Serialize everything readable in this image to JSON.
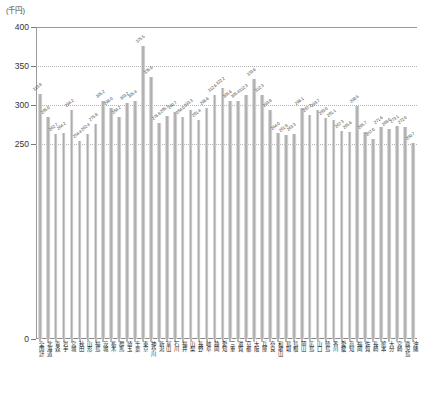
{
  "chart_data": {
    "type": "bar",
    "title": "",
    "subtitle": "",
    "unit_label": "(千円)",
    "xlabel": "",
    "ylabel": "",
    "ylim": [
      0,
      400
    ],
    "yticks": [
      0,
      250,
      300,
      350,
      400
    ],
    "ytick_labels": [
      "0",
      "250",
      "300",
      "350",
      "400"
    ],
    "gridlines": [
      250,
      300,
      350,
      400
    ],
    "grid": true,
    "legend": "none",
    "categories": [
      "全国計",
      "北海道",
      "青森",
      "岩手",
      "宮城",
      "秋田",
      "山形",
      "福島",
      "茨城",
      "栃木",
      "群馬",
      "埼玉",
      "千葉",
      "東京",
      "神奈川",
      "新潟",
      "富山",
      "石川",
      "福井",
      "山梨",
      "長野",
      "岐阜",
      "静岡",
      "愛知",
      "三重",
      "滋賀",
      "京都",
      "大阪",
      "兵庫",
      "奈良",
      "和歌山",
      "鳥取",
      "島根",
      "岡山",
      "広島",
      "山口",
      "徳島",
      "香川",
      "愛媛",
      "高知",
      "福岡",
      "佐賀",
      "長崎",
      "熊本",
      "大分",
      "宮崎",
      "鹿児島",
      "沖縄"
    ],
    "values": [
      313.8,
      285.0,
      262.7,
      264.2,
      294.2,
      254.4,
      262.4,
      275.8,
      305.2,
      296.0,
      284.2,
      303.2,
      305.4,
      375.5,
      335.6,
      276.9,
      285.7,
      290.7,
      284.0,
      293.3,
      281.4,
      296.6,
      312.6,
      322.2,
      305.6,
      305.4,
      312.3,
      333.6,
      312.3,
      293.8,
      264.0,
      261.9,
      263.3,
      296.1,
      287.2,
      293.7,
      283.0,
      281.1,
      267.3,
      265.6,
      298.5,
      265.7,
      257.0,
      271.6,
      269.0,
      273.1,
      272.0,
      250.7
    ],
    "value_labels": [
      "313.8",
      "285.0",
      "262.7",
      "264.2",
      "294.2",
      "254.4",
      "262.4",
      "275.8",
      "305.2",
      "296.0",
      "284.2",
      "303.2",
      "305.4",
      "375.5",
      "335.6",
      "276.9",
      "285.7",
      "290.7",
      "284.0",
      "293.3",
      "281.4",
      "296.6",
      "312.6",
      "322.2",
      "305.6",
      "305.4",
      "312.3",
      "333.6",
      "312.3",
      "293.8",
      "264.0",
      "261.9",
      "263.3",
      "296.1",
      "287.2",
      "293.7",
      "283.0",
      "281.1",
      "267.3",
      "265.6",
      "298.5",
      "265.7",
      "257.0",
      "271.6",
      "269.0",
      "273.1",
      "272.0",
      "250.7"
    ],
    "colors": {
      "bar": "#b0b0b0",
      "grid": "#b4b4b4",
      "axis": "#8a8a8a",
      "text": "#333333"
    }
  }
}
